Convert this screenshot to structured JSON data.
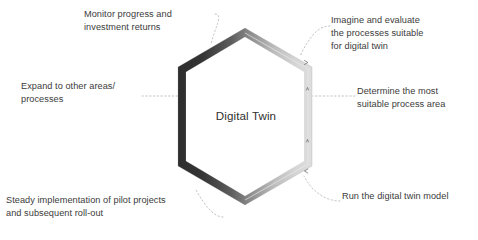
{
  "diagram": {
    "type": "hexagon-cycle",
    "center_label": "Digital Twin",
    "colors": {
      "text": "#3b3b3b",
      "center_text": "#2f2f2f",
      "background": "#ffffff",
      "border_dark": "#3a3a3a",
      "border_mid": "#9a9a9a",
      "border_light": "#d8d8d8",
      "connector": "#b9b9b9"
    },
    "steps": [
      {
        "id": "imagine",
        "order": 1,
        "text": "Imagine and evaluate\nthe processes suitable\nfor digital twin",
        "side": "right",
        "anchor": "upper-right-edge"
      },
      {
        "id": "determine",
        "order": 2,
        "text": "Determine the most\nsuitable process area",
        "side": "right",
        "anchor": "right-edge"
      },
      {
        "id": "run",
        "order": 3,
        "text": "Run the digital twin model",
        "side": "right",
        "anchor": "lower-right-edge"
      },
      {
        "id": "steady",
        "order": 4,
        "text": "Steady implementation of pilot projects\nand subsequent roll-out",
        "side": "left",
        "anchor": "lower-left-edge"
      },
      {
        "id": "expand",
        "order": 5,
        "text": "Expand to other areas/\nprocesses",
        "side": "left",
        "anchor": "left-edge"
      },
      {
        "id": "monitor",
        "order": 6,
        "text": "Monitor progress and\ninvestment returns",
        "side": "left",
        "anchor": "upper-left-edge"
      }
    ]
  }
}
